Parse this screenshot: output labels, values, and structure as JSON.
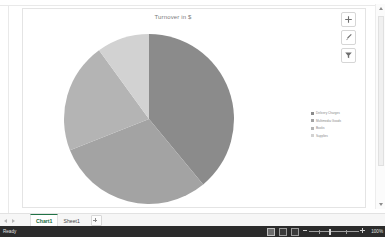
{
  "chart": {
    "title": "Turnover in $",
    "side_buttons": [
      {
        "name": "chart-elements-button",
        "icon": "plus-icon"
      },
      {
        "name": "chart-styles-button",
        "icon": "brush-icon"
      },
      {
        "name": "chart-filters-button",
        "icon": "funnel-icon"
      }
    ]
  },
  "chart_data": {
    "type": "pie",
    "title": "Turnover in $",
    "xlabel": "",
    "ylabel": "",
    "legend_position": "right",
    "grid": false,
    "categories": [
      "Delivery Charges",
      "Multimedia Goods",
      "Books",
      "Supplies"
    ],
    "values": [
      39,
      30,
      21,
      10
    ],
    "colors": [
      "#8b8b8b",
      "#a3a3a3",
      "#b4b4b4",
      "#d2d2d2"
    ],
    "start_angle": 0,
    "direction": "clockwise",
    "legend": [
      {
        "label": "Delivery Charges",
        "color": "#8b8b8b"
      },
      {
        "label": "Multimedia Goods",
        "color": "#a3a3a3"
      },
      {
        "label": "Books",
        "color": "#b4b4b4"
      },
      {
        "label": "Supplies",
        "color": "#d2d2d2"
      }
    ]
  },
  "tabs": {
    "items": [
      {
        "label": "Chart1",
        "active": true
      },
      {
        "label": "Sheet1",
        "active": false
      }
    ],
    "add_label": "+"
  },
  "status": {
    "message": "Ready",
    "zoom": "100%"
  }
}
